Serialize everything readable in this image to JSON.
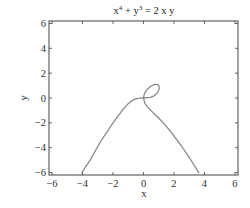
{
  "chart_data": {
    "type": "line",
    "title_parts": {
      "x_base": "x",
      "x_exp": "4",
      "plus": " + ",
      "y_base": "y",
      "y_exp": "3",
      "rhs": " = 2 x y"
    },
    "xlabel": "x",
    "ylabel": "y",
    "xlim": [
      -6.2,
      6.2
    ],
    "ylim": [
      -6.2,
      6.2
    ],
    "xticks": [
      -6,
      -4,
      -2,
      0,
      2,
      4,
      6
    ],
    "yticks": [
      -6,
      -4,
      -2,
      0,
      2,
      4,
      6
    ],
    "xtick_labels": [
      "−6",
      "−4",
      "−2",
      "0",
      "2",
      "4",
      "6"
    ],
    "ytick_labels": [
      "−6",
      "−4",
      "−2",
      "0",
      "2",
      "4",
      "6"
    ],
    "grid": false,
    "legend": null,
    "line_color": "#8a8a8a",
    "frame_color": "#444444",
    "equation": "x^4 + y^3 = 2xy",
    "series": [
      {
        "name": "left branch",
        "points": [
          [
            -4.05,
            -6.0
          ],
          [
            -3.5,
            -5.0
          ],
          [
            -2.835,
            -3.544
          ],
          [
            -2.0,
            -2.0
          ],
          [
            -1.454,
            -1.09
          ],
          [
            -1.064,
            -0.532
          ],
          [
            -0.715,
            -0.179
          ],
          [
            -0.448,
            -0.045
          ],
          [
            -0.2,
            -0.004
          ],
          [
            0.0,
            0.0
          ]
        ]
      },
      {
        "name": "loop",
        "points": [
          [
            0.0,
            0.0
          ],
          [
            0.447,
            0.045
          ],
          [
            0.699,
            0.175
          ],
          [
            0.939,
            0.47
          ],
          [
            1.032,
            0.774
          ],
          [
            1.0,
            1.0
          ],
          [
            0.882,
            1.102
          ],
          [
            0.731,
            1.096
          ],
          [
            0.472,
            0.944
          ],
          [
            0.22,
            0.66
          ],
          [
            0.08,
            0.4
          ],
          [
            0.02,
            0.15
          ],
          [
            0.0,
            0.0
          ]
        ]
      },
      {
        "name": "right branch",
        "points": [
          [
            0.0,
            0.0
          ],
          [
            0.08,
            -0.4
          ],
          [
            0.225,
            -0.675
          ],
          [
            0.536,
            -1.072
          ],
          [
            0.701,
            -1.262
          ],
          [
            0.925,
            -1.526
          ],
          [
            1.256,
            -1.947
          ],
          [
            1.742,
            -2.64
          ],
          [
            2.468,
            -3.825
          ],
          [
            3.045,
            -4.87
          ],
          [
            3.567,
            -5.886
          ],
          [
            3.63,
            -6.0
          ]
        ]
      }
    ]
  }
}
